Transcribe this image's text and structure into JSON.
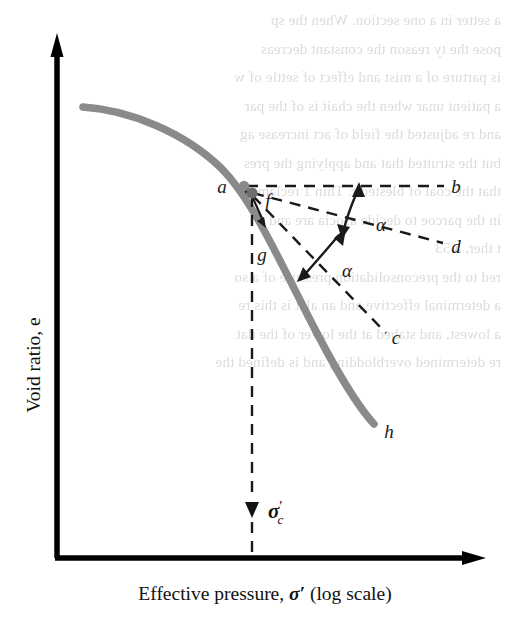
{
  "figure": {
    "axes": {
      "y_label": "Void ratio, e",
      "y_label_italic": "e",
      "x_label_pre": "Effective pressure, ",
      "x_label_symbol": "σ′",
      "x_label_post": " (log scale)",
      "x_scale": "log"
    },
    "curve": {
      "name": "e-log sigma' compression curve",
      "color": "#8a8a8a",
      "start_label": "",
      "end_label": "h"
    },
    "points": [
      {
        "id": "a",
        "label": "a",
        "desc": "point of maximum curvature"
      },
      {
        "id": "f",
        "label": "f",
        "desc": "construction point on curve"
      },
      {
        "id": "g",
        "label": "g",
        "desc": "vertical drop line label"
      }
    ],
    "rays": [
      {
        "id": "fb",
        "label": "b",
        "desc": "horizontal line from f"
      },
      {
        "id": "fd",
        "label": "d",
        "desc": "bisector of angle bfc"
      },
      {
        "id": "fc",
        "label": "c",
        "desc": "tangent to curve at f"
      }
    ],
    "angles": [
      {
        "id": "alpha-upper",
        "label": "α"
      },
      {
        "id": "alpha-lower",
        "label": "α"
      }
    ],
    "annotations": {
      "sigma_c_symbol": "σ",
      "sigma_c_prime": "′",
      "sigma_c_sub": "c"
    },
    "colors": {
      "curve": "#8a8a8a",
      "axis": "#000000",
      "dashed": "#1a1a1a",
      "background": "#ffffff",
      "bleed_text": "#dcdad6"
    }
  },
  "background_bleed": {
    "lines": [
      "a setter in a one section. When the sp",
      "pose the ty reason the constant decreas",
      "is parture of a mist and effect of settle of w",
      "a patient unar when the chait is of the par",
      "and re adjusted the field of act increase ag",
      "",
      "but the strutted that and applying the pres",
      "that the coal of blestedir. Thin 1 reclam a",
      "in the parcoe to decide asocia are and",
      "t ther, a  53",
      "",
      "",
      "red to the preconsolidation pressure of a so",
      "",
      "a determinal effective and an alet is this re",
      "a lowest, and stabed at the lower of the dat",
      "",
      "",
      "re determined overblodding and is defined the",
      ""
    ]
  }
}
